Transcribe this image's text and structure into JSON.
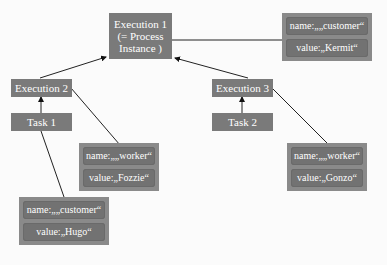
{
  "nodes": {
    "execution1": {
      "label_line1": "Execution 1",
      "label_line2": "(= Process",
      "label_line3": "Instance )"
    },
    "execution2": {
      "label": "Execution 2"
    },
    "execution3": {
      "label": "Execution 3"
    },
    "task1": {
      "label": "Task 1"
    },
    "task2": {
      "label": "Task 2"
    }
  },
  "variables": {
    "exec1_var": {
      "name": "name:„„customer“",
      "value": "value:„Kermit“"
    },
    "exec2_var": {
      "name": "name:„„worker“",
      "value": "value:„Fozzie“"
    },
    "exec3_var": {
      "name": "name:„„worker“",
      "value": "value:„Gonzo“"
    },
    "task1_var": {
      "name": "name:„„customer“",
      "value": "value:„Hugo“"
    }
  }
}
